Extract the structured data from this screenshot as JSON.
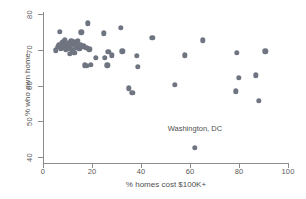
{
  "chart_data": {
    "type": "scatter",
    "title": "",
    "xlabel": "% homes cost $100K+",
    "ylabel": "% who own home",
    "xlim": [
      0,
      100
    ],
    "ylim": [
      40,
      80
    ],
    "xticks": [
      0,
      20,
      40,
      60,
      80,
      100
    ],
    "yticks": [
      40,
      50,
      60,
      70,
      80
    ],
    "grid": false,
    "legend": null,
    "marker_color": "#6f7481",
    "marker_size": 5.4,
    "points": [
      {
        "x": 5.2,
        "y": 69.8
      },
      {
        "x": 6.0,
        "y": 70.9
      },
      {
        "x": 6.4,
        "y": 71.3
      },
      {
        "x": 6.8,
        "y": 75.1
      },
      {
        "x": 7.2,
        "y": 70.2
      },
      {
        "x": 7.6,
        "y": 71.8
      },
      {
        "x": 8.0,
        "y": 72.3
      },
      {
        "x": 8.3,
        "y": 70.6
      },
      {
        "x": 8.7,
        "y": 71.1
      },
      {
        "x": 9.0,
        "y": 72.6
      },
      {
        "x": 9.4,
        "y": 69.9
      },
      {
        "x": 9.8,
        "y": 71.5
      },
      {
        "x": 10.1,
        "y": 70.4
      },
      {
        "x": 10.5,
        "y": 72.0
      },
      {
        "x": 10.9,
        "y": 68.9
      },
      {
        "x": 11.2,
        "y": 71.2
      },
      {
        "x": 11.6,
        "y": 72.4
      },
      {
        "x": 12.0,
        "y": 70.0
      },
      {
        "x": 12.4,
        "y": 71.6
      },
      {
        "x": 12.8,
        "y": 69.2
      },
      {
        "x": 13.1,
        "y": 72.1
      },
      {
        "x": 13.5,
        "y": 70.7
      },
      {
        "x": 13.9,
        "y": 71.9
      },
      {
        "x": 14.3,
        "y": 72.5
      },
      {
        "x": 14.8,
        "y": 70.3
      },
      {
        "x": 15.2,
        "y": 71.4
      },
      {
        "x": 15.7,
        "y": 74.9
      },
      {
        "x": 16.1,
        "y": 70.8
      },
      {
        "x": 16.6,
        "y": 71.0
      },
      {
        "x": 17.0,
        "y": 65.6
      },
      {
        "x": 17.6,
        "y": 70.5
      },
      {
        "x": 18.0,
        "y": 65.5
      },
      {
        "x": 18.4,
        "y": 77.4
      },
      {
        "x": 18.9,
        "y": 70.1
      },
      {
        "x": 19.6,
        "y": 65.8
      },
      {
        "x": 21.6,
        "y": 67.8
      },
      {
        "x": 24.7,
        "y": 74.6
      },
      {
        "x": 25.2,
        "y": 67.7
      },
      {
        "x": 26.2,
        "y": 65.7
      },
      {
        "x": 26.6,
        "y": 69.5
      },
      {
        "x": 28.0,
        "y": 68.5
      },
      {
        "x": 31.8,
        "y": 76.1
      },
      {
        "x": 32.4,
        "y": 69.6
      },
      {
        "x": 35.0,
        "y": 59.2
      },
      {
        "x": 36.4,
        "y": 57.9
      },
      {
        "x": 38.4,
        "y": 68.3
      },
      {
        "x": 38.8,
        "y": 65.2
      },
      {
        "x": 44.6,
        "y": 73.4
      },
      {
        "x": 53.7,
        "y": 60.2
      },
      {
        "x": 57.9,
        "y": 68.5
      },
      {
        "x": 62.0,
        "y": 42.5
      },
      {
        "x": 65.3,
        "y": 72.6
      },
      {
        "x": 78.8,
        "y": 58.4
      },
      {
        "x": 79.0,
        "y": 69.1
      },
      {
        "x": 79.9,
        "y": 62.2
      },
      {
        "x": 86.9,
        "y": 62.8
      },
      {
        "x": 88.0,
        "y": 55.8
      },
      {
        "x": 90.8,
        "y": 69.6
      }
    ],
    "annotations": [
      {
        "text": "Washington, DC",
        "x": 62.0,
        "y": 48.0,
        "points_to": {
          "x": 62.0,
          "y": 42.5
        }
      }
    ]
  }
}
